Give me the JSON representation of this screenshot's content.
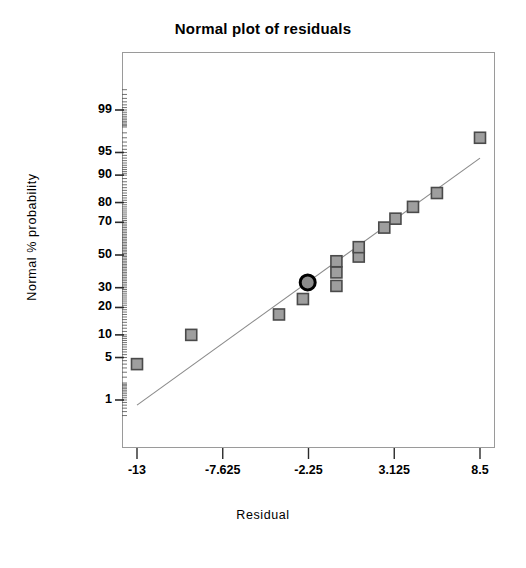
{
  "chart_data": {
    "type": "scatter",
    "title": "Normal plot of residuals",
    "xlabel": "Residual",
    "ylabel": "Normal % probability",
    "xlim": [
      -13,
      8.5
    ],
    "ylim": [
      1,
      99
    ],
    "grid": false,
    "legend": null,
    "y_scale": "normal-probability",
    "x_ticks": [
      "-13",
      "-7.625",
      "-2.25",
      "3.125",
      "8.5"
    ],
    "x_tick_values": [
      -13,
      -7.625,
      -2.25,
      3.125,
      8.5
    ],
    "y_ticks": [
      "99",
      "95",
      "90",
      "80",
      "70",
      "50",
      "30",
      "20",
      "10",
      "5",
      "1"
    ],
    "y_tick_values": [
      99,
      95,
      90,
      80,
      70,
      50,
      30,
      20,
      10,
      5,
      1
    ],
    "marker_shape": "square",
    "marker_color": "#9e9e9e",
    "marker_edge_color": "#4a4a4a",
    "highlight_marker_shape": "circle",
    "highlight_marker_color": "#8c8c8c",
    "highlight_marker_edge_color": "#000000",
    "line_color": "#8a8a8a",
    "reference_line": {
      "x_start": -13.0,
      "y_start": 0.8,
      "x_end": 8.5,
      "y_end": 94.0
    },
    "points": [
      {
        "x": -13.0,
        "y": 4.0,
        "highlight": false
      },
      {
        "x": -9.6,
        "y": 10.0,
        "highlight": false
      },
      {
        "x": -4.1,
        "y": 17.0,
        "highlight": false
      },
      {
        "x": -2.6,
        "y": 24.0,
        "highlight": false
      },
      {
        "x": -2.3,
        "y": 33.0,
        "highlight": true
      },
      {
        "x": -0.5,
        "y": 31.0,
        "highlight": false
      },
      {
        "x": -0.5,
        "y": 39.0,
        "highlight": false
      },
      {
        "x": -0.5,
        "y": 46.0,
        "highlight": false
      },
      {
        "x": 0.9,
        "y": 49.0,
        "highlight": false
      },
      {
        "x": 0.9,
        "y": 55.0,
        "highlight": false
      },
      {
        "x": 2.5,
        "y": 67.0,
        "highlight": false
      },
      {
        "x": 3.2,
        "y": 72.0,
        "highlight": false
      },
      {
        "x": 4.3,
        "y": 78.0,
        "highlight": false
      },
      {
        "x": 5.8,
        "y": 84.0,
        "highlight": false
      },
      {
        "x": 8.5,
        "y": 97.0,
        "highlight": false
      }
    ]
  },
  "axis_titles": {
    "x": "Residual",
    "y": "Normal % probability"
  }
}
